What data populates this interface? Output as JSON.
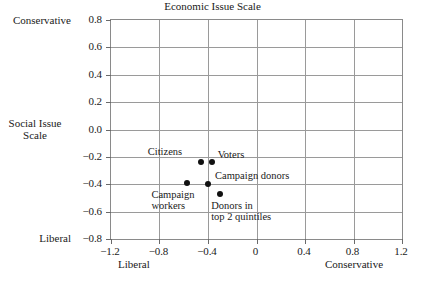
{
  "chart_data": {
    "type": "scatter",
    "title": "",
    "xlabel": "Economic Issue Scale",
    "ylabel": "Social Issue Scale",
    "xlim": [
      -1.2,
      1.2
    ],
    "ylim": [
      -0.8,
      0.8
    ],
    "xticks": [
      "-1.2",
      "-0.8",
      "-0.4",
      "0",
      "0.4",
      "0.8",
      "1.2"
    ],
    "xtick_values": [
      -1.2,
      -0.8,
      -0.4,
      0,
      0.4,
      0.8,
      1.2
    ],
    "yticks": [
      "0.8",
      "0.6",
      "0.4",
      "0.2",
      "0.0",
      "-0.2",
      "-0.4",
      "-0.6",
      "-0.8"
    ],
    "ytick_values": [
      0.8,
      0.6,
      0.4,
      0.2,
      0.0,
      -0.2,
      -0.4,
      -0.6,
      -0.8
    ],
    "grid": true,
    "legend": "none",
    "axis_end_labels": {
      "y_top": "Conservative",
      "y_bottom": "Liberal",
      "x_left": "Liberal",
      "x_right": "Conservative"
    },
    "points": [
      {
        "label": "Citizens",
        "x": -0.46,
        "y": -0.24,
        "label_offset_x": -53,
        "label_offset_y": -16,
        "label_lines": [
          "Citizens"
        ]
      },
      {
        "label": "Voters",
        "x": -0.37,
        "y": -0.24,
        "label_offset_x": 6,
        "label_offset_y": -13,
        "label_lines": [
          "Voters"
        ]
      },
      {
        "label": "Campaign workers",
        "x": -0.57,
        "y": -0.39,
        "label_offset_x": -36,
        "label_offset_y": 6,
        "label_lines": [
          "Campaign",
          "workers"
        ]
      },
      {
        "label": "Campaign donors",
        "x": -0.4,
        "y": -0.4,
        "label_offset_x": 7,
        "label_offset_y": -14,
        "label_lines": [
          "Campaign donors"
        ]
      },
      {
        "label": "Donors in top 2 quintiles",
        "x": -0.3,
        "y": -0.47,
        "label_offset_x": -9,
        "label_offset_y": 6,
        "label_lines": [
          "Donors in",
          "top 2 quintiles"
        ]
      }
    ]
  },
  "style": {
    "point_color": "#111111",
    "grid_color": "#9a9a9a",
    "frame_color": "#8a8a8a",
    "text_color": "#1a1a1a",
    "background": "#ffffff"
  }
}
